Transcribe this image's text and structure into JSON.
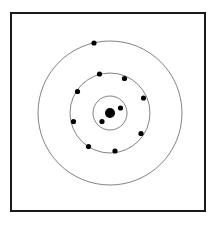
{
  "figure": {
    "background_color": "#ffffff",
    "width": 222,
    "height": 228
  },
  "frame": {
    "label": "diagram border",
    "x": 10,
    "y": 12,
    "width": 196,
    "height": 200,
    "stroke_color": "#1a1a1a",
    "stroke_width": 2,
    "fill_color": "#ffffff"
  },
  "atom": {
    "element_name": "Sodium",
    "element_symbol": "Na",
    "atomic_number": 11,
    "electron_configuration": "2, 8, 1",
    "center_x": 110,
    "center_y": 113,
    "nucleus": {
      "label": "nucleus",
      "radius": 5,
      "fill_color": "#000000"
    },
    "electron": {
      "radius": 2.6,
      "fill_color": "#000000"
    },
    "shell_stroke_color": "#4d4d4d",
    "shell_stroke_width": 0.7,
    "shells": [
      {
        "name": "K shell",
        "index": 1,
        "radius": 17,
        "electron_count": 2,
        "electrons": [
          {
            "x": 120.5,
            "y": 108.0
          },
          {
            "x": 102.0,
            "y": 121.5
          }
        ]
      },
      {
        "name": "L shell",
        "index": 2,
        "radius": 40,
        "electron_count": 8,
        "electrons": [
          {
            "x": 99.5,
            "y": 74.0
          },
          {
            "x": 124.5,
            "y": 78.5
          },
          {
            "x": 77.5,
            "y": 91.5
          },
          {
            "x": 143.5,
            "y": 98.0
          },
          {
            "x": 73.5,
            "y": 121.5
          },
          {
            "x": 141.0,
            "y": 133.5
          },
          {
            "x": 88.5,
            "y": 146.5
          },
          {
            "x": 115.0,
            "y": 151.0
          }
        ]
      },
      {
        "name": "M shell",
        "index": 3,
        "radius": 72,
        "electron_count": 1,
        "electrons": [
          {
            "x": 94.0,
            "y": 43.0
          }
        ]
      }
    ]
  }
}
